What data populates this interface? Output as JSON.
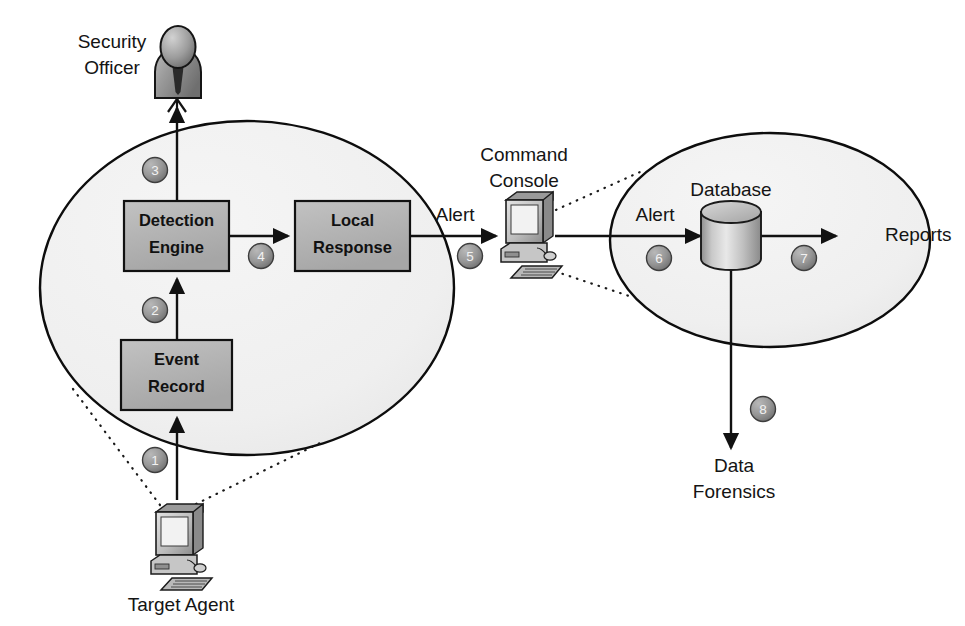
{
  "diagram": {
    "background_color": "#ffffff",
    "zone_fill_color": "#f0f0f0",
    "box_fill_color": "#b4b4b4",
    "line_color": "#111111"
  },
  "zones": [
    {
      "id": "target-zone",
      "name": "target-agent-zone"
    },
    {
      "id": "console-zone",
      "name": "command-console-zone"
    }
  ],
  "actors": [
    {
      "id": "security-officer",
      "label_line1": "Security",
      "label_line2": "Officer",
      "icon": "person-icon"
    },
    {
      "id": "command-console",
      "label_line1": "Command",
      "label_line2": "Console",
      "icon": "desktop-computer-icon"
    },
    {
      "id": "target-agent",
      "label_line1": "Target Agent",
      "label_line2": "",
      "icon": "desktop-computer-icon"
    }
  ],
  "boxes": [
    {
      "id": "detection-engine",
      "line1": "Detection",
      "line2": "Engine"
    },
    {
      "id": "local-response",
      "line1": "Local",
      "line2": "Response"
    },
    {
      "id": "event-record",
      "line1": "Event",
      "line2": "Record"
    }
  ],
  "datastores": [
    {
      "id": "database",
      "label": "Database",
      "icon": "database-cylinder-icon"
    }
  ],
  "outputs": [
    {
      "id": "reports",
      "label": "Reports"
    },
    {
      "id": "data-forensics",
      "line1": "Data",
      "line2": "Forensics"
    }
  ],
  "edge_labels": [
    {
      "id": "alert-left",
      "label": "Alert"
    },
    {
      "id": "alert-right",
      "label": "Alert"
    }
  ],
  "steps": [
    {
      "n": "1",
      "from": "target-agent",
      "to": "event-record"
    },
    {
      "n": "2",
      "from": "event-record",
      "to": "detection-engine"
    },
    {
      "n": "3",
      "from": "detection-engine",
      "to": "security-officer"
    },
    {
      "n": "4",
      "from": "detection-engine",
      "to": "local-response"
    },
    {
      "n": "5",
      "from": "local-response",
      "to": "command-console"
    },
    {
      "n": "6",
      "from": "command-console",
      "to": "database"
    },
    {
      "n": "7",
      "from": "database",
      "to": "reports"
    },
    {
      "n": "8",
      "from": "database",
      "to": "data-forensics"
    }
  ]
}
